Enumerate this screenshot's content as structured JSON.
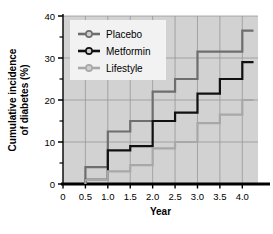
{
  "chart_data": {
    "type": "line",
    "subtype": "step",
    "title": "",
    "xlabel": "Year",
    "ylabel": "Cumulative incidence of diabetes (%)",
    "ylabel_lines": [
      "Cumulative incidence",
      "of diabetes (%)"
    ],
    "xlim": [
      0,
      4.35
    ],
    "ylim": [
      0,
      40
    ],
    "xticks": [
      0,
      0.5,
      1.0,
      1.5,
      2.0,
      2.5,
      3.0,
      3.5,
      4.0
    ],
    "xticklabels": [
      "0",
      "0.5",
      "1.0",
      "1.5",
      "2.0",
      "2.5",
      "3.0",
      "3.5",
      "4.0"
    ],
    "yticks": [
      0,
      10,
      20,
      30,
      40
    ],
    "yticklabels": [
      "0",
      "10",
      "20",
      "30",
      "40"
    ],
    "yminorticks": [
      5,
      15,
      25,
      35
    ],
    "grid": true,
    "grid_color": "#8f8f8f",
    "plot_background": "#d2d2d2",
    "legend_position": "upper left",
    "legend_background": "#f2f2f2",
    "series": [
      {
        "name": "Placebo",
        "color": "#6e6e6e",
        "x": [
          0.5,
          1.0,
          1.5,
          2.0,
          2.5,
          3.0,
          3.5,
          4.0,
          4.25
        ],
        "values": [
          4.0,
          12.5,
          15.0,
          22.0,
          25.0,
          31.5,
          31.5,
          36.5,
          36.5
        ]
      },
      {
        "name": "Metformin",
        "color": "#111111",
        "x": [
          0.5,
          1.0,
          1.5,
          2.0,
          2.5,
          3.0,
          3.5,
          4.0,
          4.25
        ],
        "values": [
          1.0,
          8.0,
          9.0,
          15.0,
          17.0,
          21.5,
          25.0,
          29.0,
          29.0
        ]
      },
      {
        "name": "Lifestyle",
        "color": "#a8a8a8",
        "x": [
          0.5,
          1.0,
          1.5,
          2.0,
          2.5,
          3.0,
          3.5,
          4.0,
          4.25
        ],
        "values": [
          1.0,
          3.0,
          4.5,
          8.5,
          10.0,
          14.5,
          16.5,
          20.0,
          20.0
        ]
      }
    ],
    "legend_entries": [
      {
        "label": "Placebo",
        "color": "#6e6e6e"
      },
      {
        "label": "Metformin",
        "color": "#111111"
      },
      {
        "label": "Lifestyle",
        "color": "#a8a8a8"
      }
    ]
  }
}
